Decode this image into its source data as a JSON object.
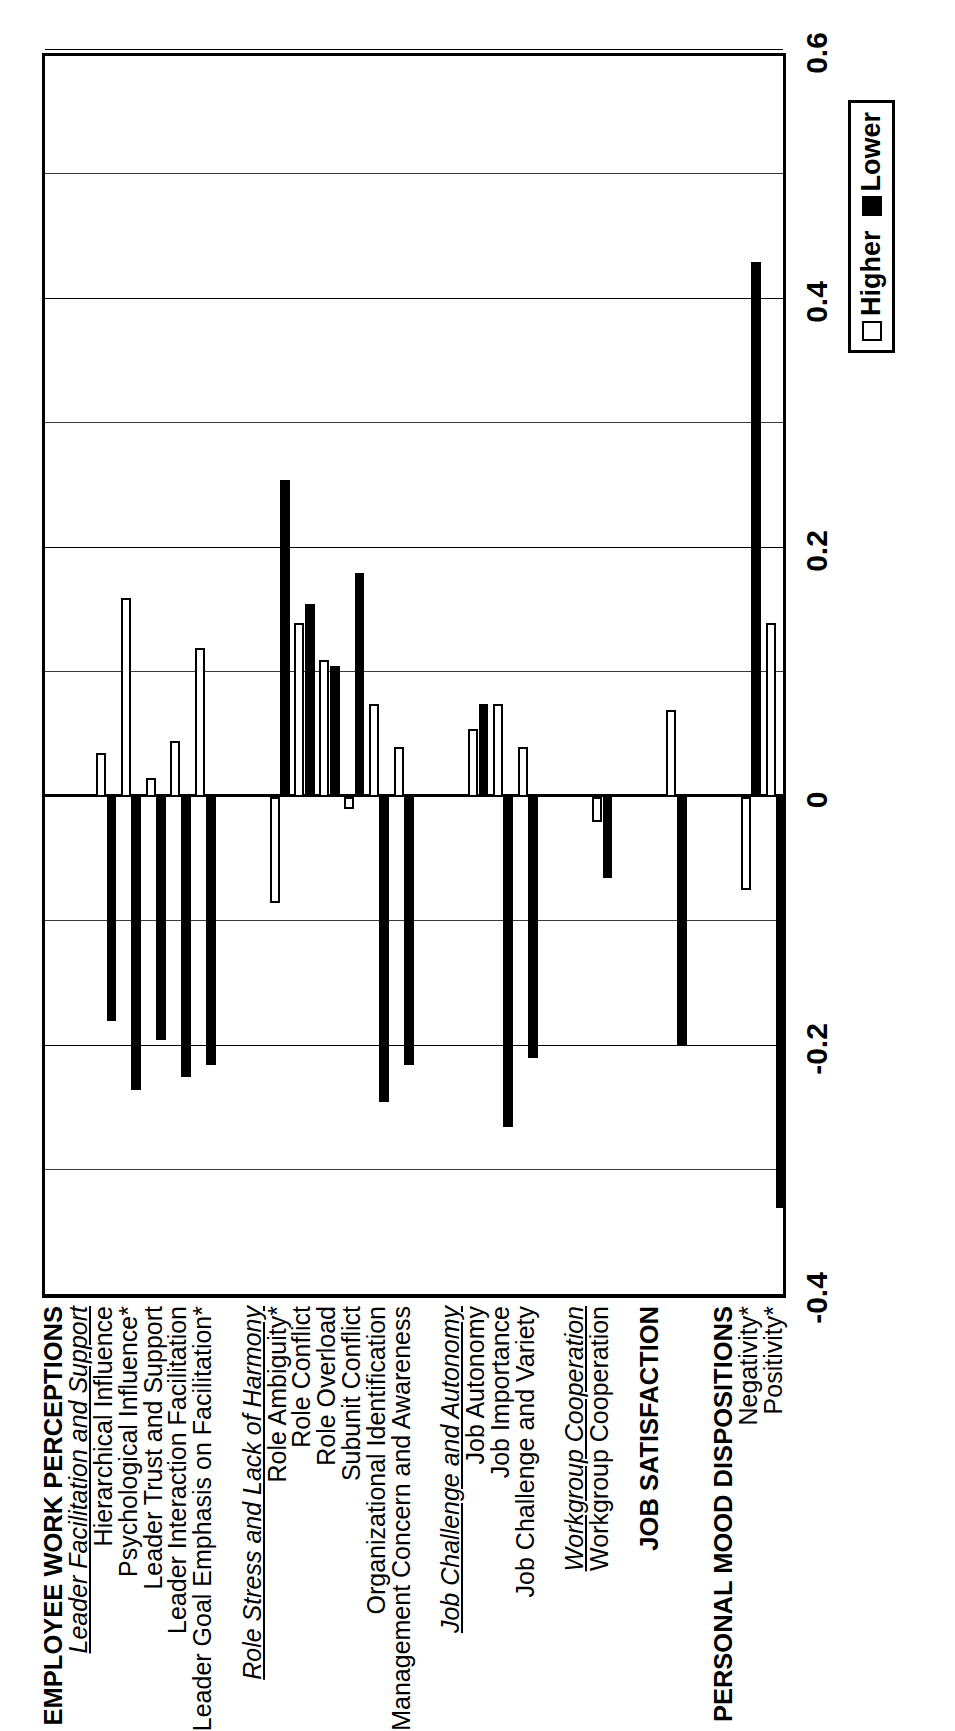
{
  "chart_data": {
    "type": "bar",
    "title": "",
    "xlabel": "",
    "ylabel": "",
    "orientation": "horizontal-rotated-90ccw",
    "axis_ticks": [
      "-0.4",
      "-0.2",
      "0",
      "0.2",
      "0.4",
      "0.6"
    ],
    "axis_range": [
      -0.4,
      0.6
    ],
    "grid": true,
    "legend_position": "bottom-right",
    "series": [
      {
        "name": "Higher",
        "fill": "#ffffff"
      },
      {
        "name": "Lower",
        "fill": "#000000"
      }
    ],
    "rows": [
      {
        "label": "EMPLOYEE WORK PERCEPTIONS",
        "kind": "group"
      },
      {
        "label": "Leader Facilitation and Support",
        "kind": "subgroup"
      },
      {
        "label": "Hierarchical Influence",
        "kind": "item",
        "higher": 0.035,
        "lower": -0.18
      },
      {
        "label": "Psychological Influence*",
        "kind": "item",
        "higher": 0.16,
        "lower": -0.235
      },
      {
        "label": "Leader Trust and Support",
        "kind": "item",
        "higher": 0.015,
        "lower": -0.195
      },
      {
        "label": "Leader Interaction Facilitation",
        "kind": "item",
        "higher": 0.045,
        "lower": -0.225
      },
      {
        "label": "Leader Goal Emphasis on Facilitation*",
        "kind": "item",
        "higher": 0.12,
        "lower": -0.215
      },
      {
        "label": "",
        "kind": "spacer"
      },
      {
        "label": "Role Stress and Lack of Harmony",
        "kind": "subgroup"
      },
      {
        "label": "Role Ambiguity*",
        "kind": "item",
        "higher": -0.085,
        "lower": 0.255
      },
      {
        "label": "Role Conflict",
        "kind": "item",
        "higher": 0.14,
        "lower": 0.155
      },
      {
        "label": "Role Overload",
        "kind": "item",
        "higher": 0.11,
        "lower": 0.105
      },
      {
        "label": "Subunit Conflict",
        "kind": "item",
        "higher": -0.01,
        "lower": 0.18
      },
      {
        "label": "Organizational Identification",
        "kind": "item",
        "higher": 0.075,
        "lower": -0.245
      },
      {
        "label": "Management Concern and Awareness",
        "kind": "item",
        "higher": 0.04,
        "lower": -0.215
      },
      {
        "label": "",
        "kind": "spacer"
      },
      {
        "label": "Job Challenge and Autonomy",
        "kind": "subgroup"
      },
      {
        "label": "Job Autonomy",
        "kind": "item",
        "higher": 0.055,
        "lower": 0.075
      },
      {
        "label": "Job Importance",
        "kind": "item",
        "higher": 0.075,
        "lower": -0.265
      },
      {
        "label": "Job Challenge and Variety",
        "kind": "item",
        "higher": 0.04,
        "lower": -0.21
      },
      {
        "label": "",
        "kind": "spacer"
      },
      {
        "label": "Workgroup Cooperation",
        "kind": "subgroup"
      },
      {
        "label": "Workgroup Cooperation",
        "kind": "item",
        "higher": -0.02,
        "lower": -0.065
      },
      {
        "label": "",
        "kind": "spacer"
      },
      {
        "label": "JOB SATISFACTION",
        "kind": "group"
      },
      {
        "label": "",
        "kind": "item",
        "higher": 0.07,
        "lower": -0.2
      },
      {
        "label": "",
        "kind": "spacer"
      },
      {
        "label": "PERSONAL MOOD DISPOSITIONS",
        "kind": "group"
      },
      {
        "label": "Negativity*",
        "kind": "item",
        "higher": -0.075,
        "lower": 0.43
      },
      {
        "label": "Positivity*",
        "kind": "item",
        "higher": 0.14,
        "lower": -0.33
      }
    ]
  },
  "legend": {
    "higher_label": "Higher",
    "lower_label": "Lower"
  }
}
